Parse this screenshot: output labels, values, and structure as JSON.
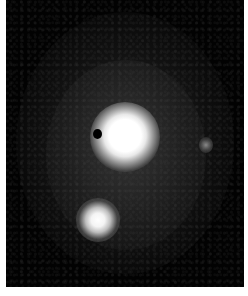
{
  "image": {
    "subject": "galaxy",
    "features": [
      {
        "name": "bright-nucleus",
        "description": "bright central core"
      },
      {
        "name": "bright-knot",
        "description": "secondary bright spot lower-left"
      },
      {
        "name": "faint-star",
        "description": "small faint point source right"
      },
      {
        "name": "dust-spot",
        "description": "dark spot left of nucleus"
      }
    ],
    "colors": {
      "background": "#020202",
      "margin": "#ffffff",
      "core": "#ffffff"
    }
  }
}
